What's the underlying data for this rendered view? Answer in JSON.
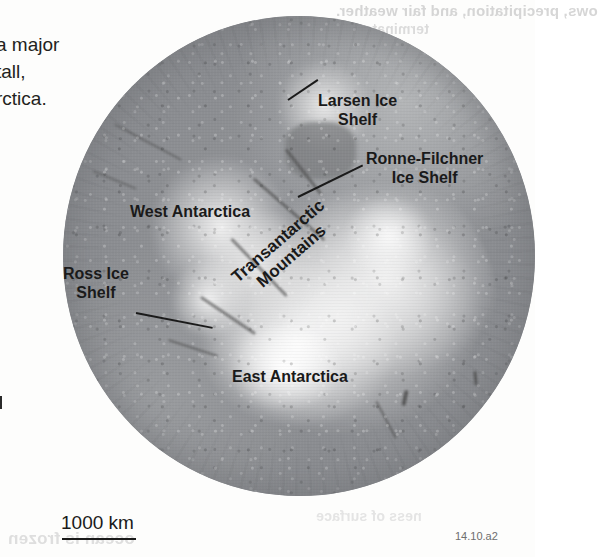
{
  "figure": {
    "number": "14.10.a2"
  },
  "body_text": {
    "line_1": "a major",
    "line_2": "tall,",
    "line_3": "rctica."
  },
  "map": {
    "labels": {
      "larsen": "Larsen Ice\nShelf",
      "ronne_filchner": "Ronne-Filchner\nIce Shelf",
      "west_antarctica": "West Antarctica",
      "ross": "Ross Ice\nShelf",
      "transantarctic": "Transantarctic\nMountains",
      "east_antarctica": "East Antarctica"
    },
    "scalebar": {
      "label": "1000 km"
    },
    "colors": {
      "ocean": "#8e9094",
      "ice": "#fbfbfb",
      "rock": "#4a4a4a",
      "label_text": "#1a1a1a"
    }
  },
  "bleedthrough": {
    "top_1": "ows, precipitation, and fair weather.",
    "top_2": "terminates.",
    "bottom_1": "ocean is frozen",
    "bottom_2": "ness of surface"
  }
}
